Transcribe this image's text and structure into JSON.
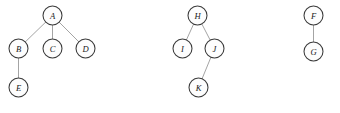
{
  "diagram": {
    "canvas": {
      "width": 340,
      "height": 113,
      "background": "#ffffff"
    },
    "style": {
      "node_radius": 9.5,
      "node_fill": "#fdfdfd",
      "node_stroke": "#3a3a3a",
      "edge_stroke": "#9a9a9a",
      "label_color": "#1a1a1a"
    },
    "components": [
      {
        "name": "tree-1",
        "root": "A",
        "nodes": [
          {
            "id": "A",
            "label": "A",
            "x": 52.5,
            "y": 15.5
          },
          {
            "id": "B",
            "label": "B",
            "x": 18.5,
            "y": 48.5
          },
          {
            "id": "C",
            "label": "C",
            "x": 52.5,
            "y": 48.5
          },
          {
            "id": "D",
            "label": "D",
            "x": 85.5,
            "y": 48.5
          },
          {
            "id": "E",
            "label": "E",
            "x": 18.5,
            "y": 87.5
          }
        ],
        "edges": [
          {
            "from": "A",
            "to": "B"
          },
          {
            "from": "A",
            "to": "C"
          },
          {
            "from": "A",
            "to": "D"
          },
          {
            "from": "B",
            "to": "E"
          }
        ]
      },
      {
        "name": "tree-2",
        "root": "H",
        "nodes": [
          {
            "id": "H",
            "label": "H",
            "x": 197.5,
            "y": 15.5
          },
          {
            "id": "I",
            "label": "I",
            "x": 182.5,
            "y": 48.5
          },
          {
            "id": "J",
            "label": "J",
            "x": 214.5,
            "y": 48.5
          },
          {
            "id": "K",
            "label": "K",
            "x": 198.5,
            "y": 87.5
          }
        ],
        "edges": [
          {
            "from": "H",
            "to": "I"
          },
          {
            "from": "H",
            "to": "J"
          },
          {
            "from": "J",
            "to": "K"
          }
        ]
      },
      {
        "name": "tree-3",
        "root": "F",
        "nodes": [
          {
            "id": "F",
            "label": "F",
            "x": 313.5,
            "y": 15.5
          },
          {
            "id": "G",
            "label": "G",
            "x": 313.5,
            "y": 51.5
          }
        ],
        "edges": [
          {
            "from": "F",
            "to": "G"
          }
        ]
      }
    ]
  }
}
